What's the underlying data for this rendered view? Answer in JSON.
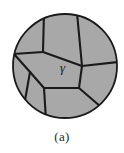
{
  "figure": {
    "caption": "(a)",
    "phase_label": "γ",
    "colors": {
      "grain_fill": "#a8a8a8",
      "grain_boundary": "#1a1a1a",
      "circle_outline": "#1a1a1a",
      "background": "#ffffff",
      "label_text": "#1a1a1a",
      "caption_text": "#2b2b2b"
    },
    "circle": {
      "cx": 65,
      "cy": 66,
      "r": 52,
      "stroke_width": 1.6
    },
    "label_position": {
      "x": 60,
      "y": 72
    },
    "grain_boundaries": [
      {
        "name": "boundary-top-left-vertical",
        "path": "M 44 14.6 L 43 52"
      },
      {
        "name": "boundary-top-right-slant",
        "path": "M 77 15.5 L 82 66"
      },
      {
        "name": "boundary-upper-left-to-rim",
        "path": "M 43 52 L 14.5 54"
      },
      {
        "name": "boundary-central-upper-right",
        "path": "M 43 52 L 82 66"
      },
      {
        "name": "boundary-left-wedge",
        "path": "M 14.5 54 L 30 72"
      },
      {
        "name": "boundary-left-lower-rim",
        "path": "M 30 72 L 25 104"
      },
      {
        "name": "boundary-central-left-down",
        "path": "M 30 72 L 44 88"
      },
      {
        "name": "boundary-central-lower",
        "path": "M 44 88 L 79 88"
      },
      {
        "name": "boundary-bottom-vertical",
        "path": "M 44 88 L 46 117"
      },
      {
        "name": "boundary-right-lower-rim",
        "path": "M 79 88 L 99 105"
      },
      {
        "name": "boundary-right-mid-rim",
        "path": "M 82 66 L 116 62"
      },
      {
        "name": "boundary-central-right-down",
        "path": "M 82 66 L 79 88"
      }
    ],
    "grain_count": 8
  }
}
